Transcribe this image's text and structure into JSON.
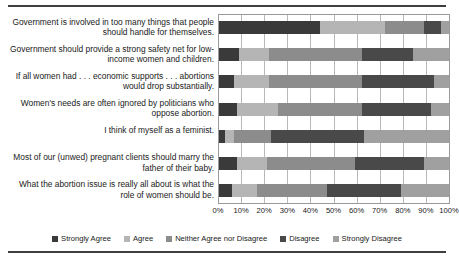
{
  "chart_data": {
    "type": "bar",
    "orientation": "horizontal",
    "stacked": true,
    "stack_mode": "percent",
    "title": "",
    "xlabel": "",
    "ylabel": "",
    "xlim": [
      0,
      100
    ],
    "grid": true,
    "legend_position": "bottom",
    "xticks": [
      "0%",
      "10%",
      "20%",
      "30%",
      "40%",
      "50%",
      "60%",
      "70%",
      "80%",
      "90%",
      "100%"
    ],
    "xtick_values": [
      0,
      10,
      20,
      30,
      40,
      50,
      60,
      70,
      80,
      90,
      100
    ],
    "categories": [
      "Government is involved in too many things that people should handle for themselves.",
      "Government should provide a strong safety net for low-income women and children.",
      "If all women had . . . economic supports . . . abortions would drop substantially.",
      "Women's needs are often ignored by politicians who oppose abortion.",
      "I think of myself as a feminist.",
      "Most of our (unwed) pregnant clients should marry the father of their baby.",
      "What the abortion issue is really all about is what the role of women should be."
    ],
    "series": [
      {
        "name": "Strongly Agree",
        "color": "#3a3a3a",
        "values": [
          44,
          9,
          7,
          8,
          3,
          8,
          6
        ]
      },
      {
        "name": "Agree",
        "color": "#b5b5b5",
        "values": [
          28,
          13,
          15,
          18,
          4,
          13,
          11
        ]
      },
      {
        "name": "Neither Agree nor Disagree",
        "color": "#8c8c8c",
        "values": [
          17,
          40,
          40,
          36,
          16,
          38,
          30
        ]
      },
      {
        "name": "Disagree",
        "color": "#494949",
        "values": [
          7,
          22,
          31,
          30,
          40,
          30,
          32
        ]
      },
      {
        "name": "Strongly Disagree",
        "color": "#a0a0a0",
        "values": [
          4,
          16,
          7,
          8,
          37,
          11,
          21
        ]
      }
    ]
  }
}
